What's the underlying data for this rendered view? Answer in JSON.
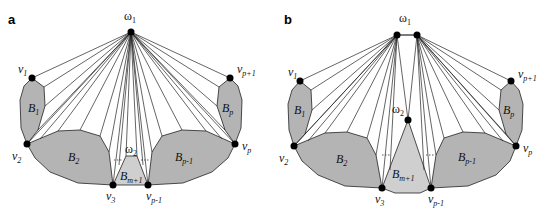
{
  "colors": {
    "block_fill": "#b4b4b4",
    "block_light_fill": "#cfcfcf",
    "edge": "#222222",
    "vertex": "#000000"
  },
  "panels": [
    {
      "letter": "a",
      "labels": {
        "omega1": "ω",
        "omega1_sub": "1",
        "omega2": "ω",
        "omega2_sub": "2",
        "v1": "v",
        "v1_sub": "1",
        "v2": "v",
        "v2_sub": "2",
        "v3": "v",
        "v3_sub": "3",
        "vp_minus_1": "v",
        "vp_minus_1_sub": "p-1",
        "vp": "v",
        "vp_sub": "p",
        "vp_plus_1": "v",
        "vp_plus_1_sub": "p+1",
        "B1": "B",
        "B1_sub": "1",
        "B2": "B",
        "B2_sub": "2",
        "Bm1": "B",
        "Bm1_sub": "m+1",
        "Bp1": "B",
        "Bp1_sub": "p-1",
        "Bp": "B",
        "Bp_sub": "p"
      }
    },
    {
      "letter": "b",
      "labels": {
        "omega1": "ω",
        "omega1_sub": "1",
        "omega2": "ω",
        "omega2_sub": "2",
        "v1": "v",
        "v1_sub": "1",
        "v2": "v",
        "v2_sub": "2",
        "v3": "v",
        "v3_sub": "3",
        "vp_minus_1": "v",
        "vp_minus_1_sub": "p-1",
        "vp": "v",
        "vp_sub": "p",
        "vp_plus_1": "v",
        "vp_plus_1_sub": "p+1",
        "B1": "B",
        "B1_sub": "1",
        "B2": "B",
        "B2_sub": "2",
        "Bm1": "B",
        "Bm1_sub": "m+1",
        "Bp1": "B",
        "Bp1_sub": "p-1",
        "Bp": "B",
        "Bp_sub": "p"
      }
    }
  ]
}
